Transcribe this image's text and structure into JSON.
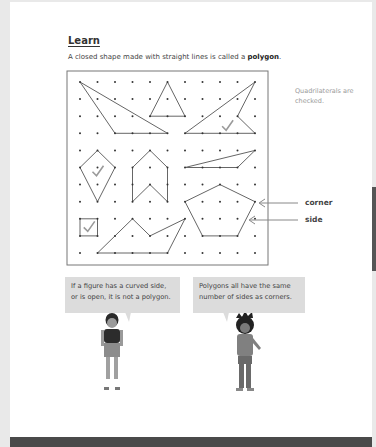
{
  "lesson": {
    "heading": "Learn",
    "intro_prefix": "A closed shape made with straight lines is called a ",
    "intro_term": "polygon",
    "intro_suffix": ".",
    "note": "Quadrilaterals are checked."
  },
  "diagram": {
    "grid": {
      "cols": 11,
      "rows": 11,
      "x0": 80,
      "y0": 82,
      "dx": 17.5,
      "dy": 17.1
    },
    "labels": {
      "corner": "corner",
      "side": "side"
    },
    "shapes": [
      {
        "name": "triangle-large",
        "points": [
          [
            0,
            0
          ],
          [
            2,
            3
          ],
          [
            5,
            3
          ]
        ],
        "checked": false
      },
      {
        "name": "triangle-small",
        "points": [
          [
            5,
            0
          ],
          [
            6,
            2
          ],
          [
            4,
            2
          ]
        ],
        "checked": false
      },
      {
        "name": "concave-quadrilateral",
        "points": [
          [
            10,
            0
          ],
          [
            6,
            3
          ],
          [
            10,
            3
          ],
          [
            9,
            2
          ]
        ],
        "checked": true
      },
      {
        "name": "kite",
        "points": [
          [
            1,
            4
          ],
          [
            2,
            5
          ],
          [
            1,
            7
          ],
          [
            0,
            5
          ]
        ],
        "checked": true
      },
      {
        "name": "chevron-hexagon",
        "points": [
          [
            4,
            4
          ],
          [
            5,
            5
          ],
          [
            5,
            7
          ],
          [
            4,
            6
          ],
          [
            3,
            7
          ],
          [
            3,
            5
          ]
        ],
        "checked": false
      },
      {
        "name": "thin-triangle",
        "points": [
          [
            10,
            4
          ],
          [
            6,
            5
          ],
          [
            9,
            5
          ]
        ],
        "checked": false
      },
      {
        "name": "pentagon",
        "points": [
          [
            8,
            6
          ],
          [
            10,
            7
          ],
          [
            9,
            9
          ],
          [
            7,
            9
          ],
          [
            6,
            7
          ]
        ],
        "checked": false
      },
      {
        "name": "square",
        "points": [
          [
            0,
            8
          ],
          [
            1,
            8
          ],
          [
            1,
            9
          ],
          [
            0,
            9
          ]
        ],
        "checked": true
      },
      {
        "name": "concave-pentagon",
        "points": [
          [
            1,
            10
          ],
          [
            3,
            8
          ],
          [
            4,
            9
          ],
          [
            6,
            8
          ],
          [
            5,
            10
          ]
        ],
        "checked": false
      }
    ]
  },
  "bubbles": [
    {
      "line1": "If a figure has a curved side,",
      "line2": "or is open, it is not a polygon."
    },
    {
      "line1": "Polygons all have the same",
      "line2": "number of sides as corners."
    }
  ],
  "footer": {
    "page_left": "",
    "page_right": ""
  },
  "colors": {
    "line": "#666666",
    "dot": "#333333",
    "bubble": "#dcdcdc",
    "footer": "#4a4a4a"
  }
}
